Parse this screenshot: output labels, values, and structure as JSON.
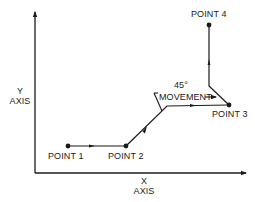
{
  "diagram": {
    "axes": {
      "y_label_line1": "Y",
      "y_label_line2": "AXIS",
      "x_label_line1": "X",
      "x_label_line2": "AXIS"
    },
    "points": [
      {
        "label": "POINT 1"
      },
      {
        "label": "POINT 2"
      },
      {
        "label": "POINT 3"
      },
      {
        "label": "POINT 4"
      }
    ],
    "annotation": {
      "angle": "45°",
      "text": "MOVEMENT"
    },
    "colors": {
      "line": "#1a1a1a",
      "background": "#ffffff"
    }
  }
}
